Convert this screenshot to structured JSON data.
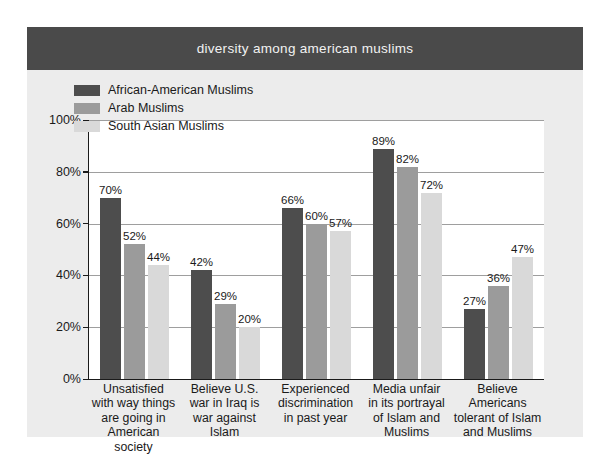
{
  "header": {
    "title": "diversity among american muslims"
  },
  "chart_data": {
    "type": "bar",
    "title": "diversity among american muslims",
    "xlabel": "",
    "ylabel": "",
    "ylim": [
      0,
      100
    ],
    "yticks": [
      "0%",
      "20%",
      "40%",
      "60%",
      "80%",
      "100%"
    ],
    "ytick_values": [
      0,
      20,
      40,
      60,
      80,
      100
    ],
    "grid": true,
    "legend_position": "top-left inside plot",
    "value_suffix": "%",
    "categories": [
      "Unsatisfied with way things are going in American society",
      "Believe U.S. war in Iraq is war against Islam",
      "Experienced discrimination in past year",
      "Media unfair in its portrayal of Islam and Muslims",
      "Believe Americans tolerant of Islam and Muslims"
    ],
    "category_lines": [
      [
        "Unsatisfied",
        "with way things",
        "are going in",
        "American",
        "society"
      ],
      [
        "Believe U.S.",
        "war in Iraq is",
        "war against",
        "Islam"
      ],
      [
        "Experienced",
        "discrimination",
        "in past year"
      ],
      [
        "Media unfair",
        "in its portrayal",
        "of Islam and",
        "Muslims"
      ],
      [
        "Believe",
        "Americans",
        "tolerant of Islam",
        "and Muslims"
      ]
    ],
    "series": [
      {
        "name": "African-American Muslims",
        "color": "#4d4d4d",
        "values": [
          70,
          42,
          66,
          89,
          27
        ],
        "labels": [
          "70%",
          "42%",
          "66%",
          "89%",
          "27%"
        ]
      },
      {
        "name": "Arab Muslims",
        "color": "#9b9b9b",
        "values": [
          52,
          29,
          60,
          82,
          36
        ],
        "labels": [
          "52%",
          "29%",
          "60%",
          "82%",
          "36%"
        ]
      },
      {
        "name": "South Asian Muslims",
        "color": "#d9d9d9",
        "values": [
          44,
          20,
          57,
          72,
          47
        ],
        "labels": [
          "44%",
          "20%",
          "57%",
          "72%",
          "47%"
        ]
      }
    ]
  },
  "colors": {
    "header_band": "#4a4a4a",
    "page_background": "#ececec",
    "plot_background": "#ffffff",
    "axis": "#1a1a1a",
    "gridline": "#9e9e9e"
  }
}
